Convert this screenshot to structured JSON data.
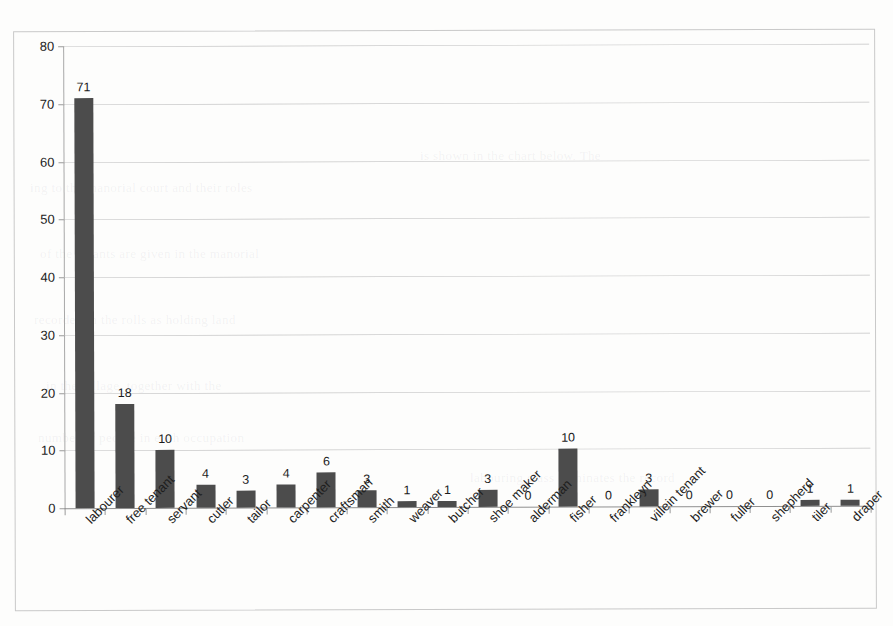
{
  "chart_data": {
    "type": "bar",
    "title": "",
    "subtitle": "",
    "xlabel": "",
    "ylabel": "",
    "ylim": [
      0,
      80
    ],
    "y_ticks": [
      0,
      10,
      20,
      30,
      40,
      50,
      60,
      70,
      80
    ],
    "grid": true,
    "legend": null,
    "bar_color": "#4c4c4c",
    "categories": [
      "labourer",
      "free tenant",
      "servant",
      "cutler",
      "tailor",
      "carpenter",
      "craftsman",
      "smith",
      "weaver",
      "butcher",
      "shoe maker",
      "alderman",
      "fisher",
      "frankleyn",
      "villein tenant",
      "brewer",
      "fuller",
      "shepherd",
      "tiler",
      "draper"
    ],
    "values": [
      71,
      18,
      10,
      4,
      3,
      4,
      6,
      3,
      1,
      1,
      3,
      0,
      10,
      0,
      3,
      0,
      0,
      0,
      1,
      1
    ],
    "data_labels": [
      "71",
      "18",
      "10",
      "4",
      "3",
      "4",
      "6",
      "3",
      "1",
      "1",
      "3",
      "0",
      "10",
      "0",
      "3",
      "0",
      "0",
      "0",
      "1",
      "1"
    ]
  },
  "background_text": [
    "ing to the manorial court and their roles",
    "of the tenants are given in the manorial",
    "recorded in the rolls as holding land",
    "in the village, together with the",
    "number of people in each occupation",
    "is shown in the chart below. The",
    "labouring class dominates the record"
  ]
}
